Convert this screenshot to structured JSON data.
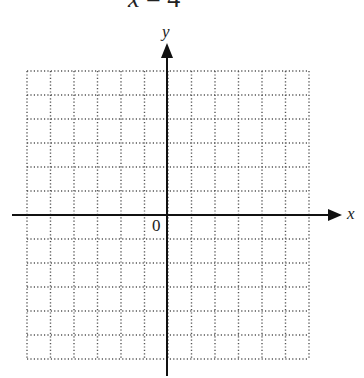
{
  "title": {
    "text": "x = 4",
    "variable": "x",
    "equals": "=",
    "value": "4"
  },
  "axes": {
    "x_label": "x",
    "y_label": "y",
    "origin_label": "0"
  },
  "grid": {
    "columns": 12,
    "rows": 12,
    "style": "dotted",
    "color": "#555555"
  },
  "chart_data": {
    "type": "scatter",
    "title": "x = 4",
    "xlabel": "x",
    "ylabel": "y",
    "xlim": [
      -6,
      6
    ],
    "ylim": [
      -6,
      6
    ],
    "grid": true,
    "series": [],
    "annotations": [
      "0"
    ]
  }
}
